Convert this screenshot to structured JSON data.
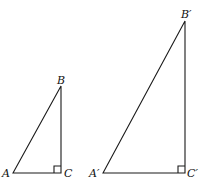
{
  "figure": {
    "stroke_color": "#1a1a1a",
    "small_triangle": {
      "labels": {
        "A": "A",
        "B": "B",
        "C": "C"
      },
      "vertices": {
        "A": [
          13,
          173
        ],
        "B": [
          61,
          86
        ],
        "C": [
          61,
          173
        ]
      },
      "right_angle_at": "C"
    },
    "large_triangle": {
      "labels": {
        "A": "A′",
        "B": "B′",
        "C": "C′"
      },
      "vertices": {
        "A": [
          103,
          173
        ],
        "B": [
          185,
          21
        ],
        "C": [
          185,
          173
        ]
      },
      "right_angle_at": "C′"
    }
  }
}
